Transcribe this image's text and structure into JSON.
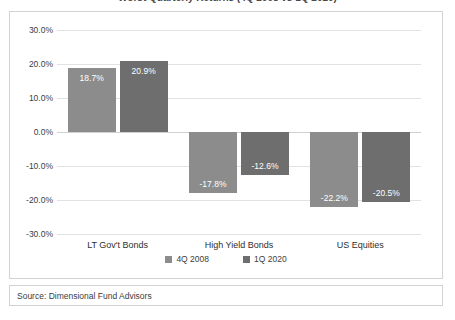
{
  "title_sliver": "Worst Quarterly Returns (4Q 2008 vs 1Q 2020)",
  "source": {
    "label": "Source: Dimensional Fund Advisors"
  },
  "colors": {
    "series_2008": "#8c8c8c",
    "series_2020": "#6e6e6e",
    "gridline": "#e2e2e2",
    "zeroline": "#d0d0d0",
    "border": "#d2d2d2",
    "text": "#3d3d3d",
    "bar_label": "#ffffff"
  },
  "chart_data": {
    "type": "bar",
    "title": "",
    "xlabel": "",
    "ylabel": "",
    "ylim": [
      -30,
      30
    ],
    "grid": true,
    "legend_position": "bottom",
    "categories": [
      "LT Gov't Bonds",
      "High Yield Bonds",
      "US Equities"
    ],
    "ytick_labels": [
      "30.0%",
      "20.0%",
      "10.0%",
      "0.0%",
      "-10.0%",
      "-20.0%",
      "-30.0%"
    ],
    "ytick_values": [
      30,
      20,
      10,
      0,
      -10,
      -20,
      -30
    ],
    "series": [
      {
        "name": "4Q 2008",
        "color": "#8c8c8c",
        "values": [
          18.7,
          -17.8,
          -22.2
        ],
        "labels": [
          "18.7%",
          "-17.8%",
          "-22.2%"
        ]
      },
      {
        "name": "1Q 2020",
        "color": "#6e6e6e",
        "values": [
          20.9,
          -12.6,
          -20.5
        ],
        "labels": [
          "20.9%",
          "-12.6%",
          "-20.5%"
        ]
      }
    ]
  }
}
